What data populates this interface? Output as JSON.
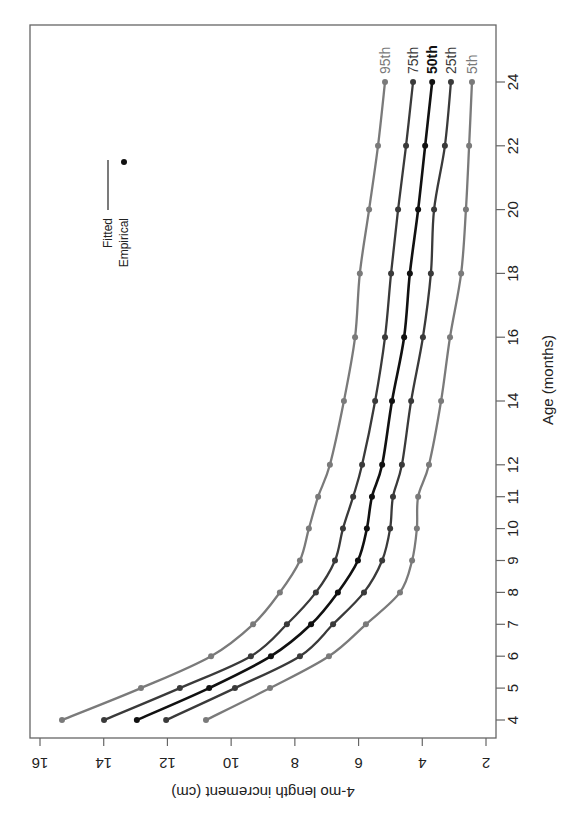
{
  "chart_data": {
    "type": "line",
    "orientation": "rotated 90 degrees clockwise",
    "title": "",
    "xlabel": "Age (months)",
    "ylabel": "4-mo length increment (cm)",
    "x": [
      4,
      5,
      6,
      7,
      8,
      9,
      10,
      11,
      12,
      14,
      16,
      18,
      20,
      22,
      24
    ],
    "x_ticks": [
      4,
      5,
      6,
      7,
      8,
      9,
      10,
      11,
      12,
      14,
      16,
      18,
      20,
      22,
      24
    ],
    "y_ticks": [
      2,
      4,
      6,
      8,
      10,
      12,
      14,
      16
    ],
    "ylim": [
      1.7,
      16.3
    ],
    "grid": false,
    "series": [
      {
        "name": "95th",
        "color": "#7a7a7a",
        "values": [
          15.31,
          12.83,
          10.63,
          9.31,
          8.47,
          7.84,
          7.56,
          7.27,
          6.9,
          6.46,
          6.11,
          5.96,
          5.67,
          5.39,
          5.17
        ]
      },
      {
        "name": "75th",
        "color": "#3a3a3a",
        "values": [
          13.99,
          11.61,
          9.38,
          8.25,
          7.34,
          6.74,
          6.49,
          6.17,
          5.89,
          5.48,
          5.17,
          4.98,
          4.76,
          4.51,
          4.29
        ]
      },
      {
        "name": "50th",
        "color": "#111111",
        "values": [
          12.96,
          10.69,
          8.75,
          7.49,
          6.65,
          6.02,
          5.74,
          5.58,
          5.26,
          4.95,
          4.57,
          4.39,
          4.13,
          3.91,
          3.69
        ]
      },
      {
        "name": "25th",
        "color": "#3a3a3a",
        "values": [
          12.04,
          9.88,
          7.84,
          6.8,
          5.83,
          5.26,
          5.01,
          4.92,
          4.64,
          4.35,
          3.98,
          3.73,
          3.63,
          3.29,
          3.1
        ]
      },
      {
        "name": "5th",
        "color": "#7a7a7a",
        "values": [
          10.79,
          8.78,
          6.93,
          5.77,
          4.7,
          4.32,
          4.17,
          4.13,
          3.79,
          3.41,
          3.13,
          2.78,
          2.63,
          2.53,
          2.44
        ]
      }
    ],
    "legend": {
      "position": "top-left (rotated)",
      "entries": [
        {
          "label": "Fitted",
          "symbol": "line"
        },
        {
          "label": "Empirical",
          "symbol": "point"
        }
      ]
    }
  }
}
